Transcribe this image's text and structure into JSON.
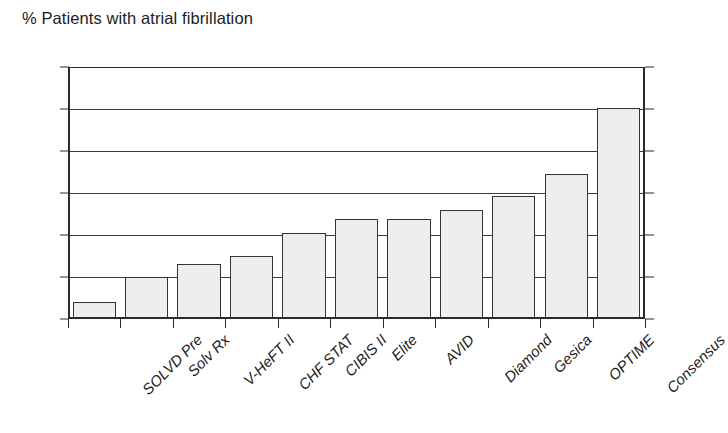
{
  "chart_data": {
    "type": "bar",
    "title": "% Patients with atrial fibrillation",
    "xlabel": "",
    "ylabel": "",
    "ylim": [
      0,
      0.6
    ],
    "yticks": [
      0,
      0.1,
      0.2,
      0.3,
      0.4,
      0.5,
      0.6
    ],
    "ytick_labels": [
      "0",
      "0.1",
      "0.2",
      "0.3",
      "0.4",
      "0.5",
      "0.6"
    ],
    "grid": true,
    "legend": null,
    "categories": [
      "SOLVD Pre",
      "Solv Rx",
      "V-HeFT II",
      "CHF STAT",
      "CIBIS II",
      "Elite",
      "AVID",
      "Diamond",
      "Gesica",
      "OPTIME",
      "Consensus"
    ],
    "values": [
      0.04,
      0.1,
      0.13,
      0.15,
      0.205,
      0.237,
      0.237,
      0.26,
      0.293,
      0.345,
      0.503
    ],
    "bar_fill_color": "#eeeeee",
    "bar_edge_color": "#333333",
    "axis_color": "#2b2b2b",
    "background_color": "#ffffff"
  }
}
